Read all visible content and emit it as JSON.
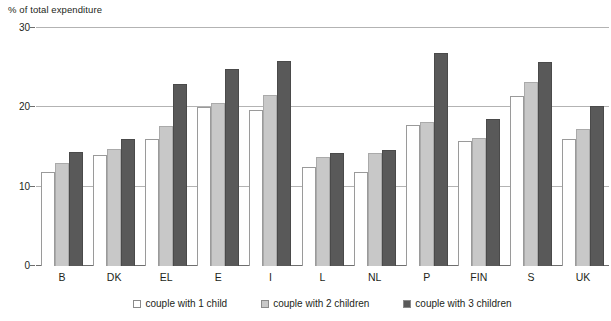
{
  "chart_data": {
    "type": "bar",
    "title": "% of total expenditure",
    "xlabel": "",
    "ylabel": "% of total expenditure",
    "ylim": [
      0,
      30
    ],
    "yticks": [
      0,
      10,
      20,
      30
    ],
    "grid": true,
    "legend_position": "bottom",
    "categories": [
      "B",
      "DK",
      "EL",
      "E",
      "I",
      "L",
      "NL",
      "P",
      "FIN",
      "S",
      "UK"
    ],
    "series": [
      {
        "name": "couple with 1 child",
        "color": "#ffffff",
        "values": [
          11.9,
          14.0,
          16.0,
          20.1,
          19.7,
          12.5,
          11.9,
          17.8,
          15.8,
          21.4,
          16.0
        ]
      },
      {
        "name": "couple with 2 children",
        "color": "#c8c8c8",
        "values": [
          13.0,
          14.7,
          17.6,
          20.6,
          21.6,
          13.7,
          14.3,
          18.1,
          16.1,
          23.2,
          17.3
        ]
      },
      {
        "name": "couple with 3 children",
        "color": "#595959",
        "values": [
          14.4,
          16.0,
          22.9,
          24.8,
          25.8,
          14.3,
          14.6,
          26.8,
          18.5,
          25.7,
          20.2
        ]
      }
    ]
  },
  "legend": {
    "items": [
      {
        "label": "couple with 1 child",
        "swatch": "white-swatch"
      },
      {
        "label": "couple with 2 children",
        "swatch": "light-gray-swatch"
      },
      {
        "label": "couple with 3 children",
        "swatch": "dark-gray-swatch"
      }
    ]
  }
}
